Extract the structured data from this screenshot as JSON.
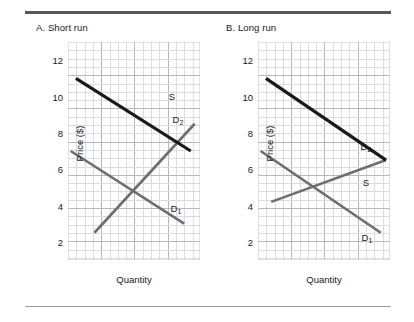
{
  "figure": {
    "panels": [
      {
        "id": "panel-a",
        "title": "A. Short run",
        "xlabel": "Quantity",
        "ylabel": "Price ($)",
        "yticks": [
          "12",
          "10",
          "8",
          "6",
          "4",
          "2"
        ],
        "labels": {
          "supply": "S",
          "demand1": "D",
          "demand1_sub": "1",
          "demand2": "D",
          "demand2_sub": "2"
        }
      },
      {
        "id": "panel-b",
        "title": "B. Long run",
        "xlabel": "Quantity",
        "ylabel": "Price ($)",
        "yticks": [
          "12",
          "10",
          "8",
          "6",
          "4",
          "2"
        ],
        "labels": {
          "supply": "S",
          "demand1": "D",
          "demand1_sub": "1",
          "demand2": "D",
          "demand2_sub": "2"
        }
      }
    ]
  },
  "chart_data": [
    {
      "type": "line",
      "title": "A. Short run",
      "xlabel": "Quantity",
      "ylabel": "Price ($)",
      "ylim": [
        1,
        13
      ],
      "yticks": [
        2,
        4,
        6,
        8,
        10,
        12
      ],
      "grid": true,
      "legend": "inline-curve-labels",
      "series": [
        {
          "name": "S",
          "role": "supply",
          "color": "#6e6e70",
          "width": 2.6,
          "note": "Steep short-run supply: inelastic",
          "points": [
            {
              "x": 0.2,
              "y": 2.5
            },
            {
              "x": 0.96,
              "y": 8.5
            }
          ]
        },
        {
          "name": "D1",
          "role": "demand-initial",
          "color": "#6e6e70",
          "width": 2.6,
          "points": [
            {
              "x": 0.02,
              "y": 7.0
            },
            {
              "x": 0.88,
              "y": 3.0
            }
          ]
        },
        {
          "name": "D2",
          "role": "demand-shifted",
          "color": "#1a1a1a",
          "width": 3.2,
          "note": "Demand shifts right/up",
          "points": [
            {
              "x": 0.06,
              "y": 11.0
            },
            {
              "x": 0.93,
              "y": 7.0
            }
          ]
        }
      ],
      "equilibria": [
        {
          "label": "initial",
          "x": 0.5,
          "y": 5.0
        },
        {
          "label": "after shift",
          "x": 0.82,
          "y": 7.5
        }
      ]
    },
    {
      "type": "line",
      "title": "B. Long run",
      "xlabel": "Quantity",
      "ylabel": "Price ($)",
      "ylim": [
        1,
        13
      ],
      "yticks": [
        2,
        4,
        6,
        8,
        10,
        12
      ],
      "grid": true,
      "legend": "inline-curve-labels",
      "series": [
        {
          "name": "S",
          "role": "supply",
          "color": "#6e6e70",
          "width": 2.6,
          "note": "Flat long-run supply: elastic",
          "points": [
            {
              "x": 0.1,
              "y": 4.2
            },
            {
              "x": 0.97,
              "y": 6.5
            }
          ]
        },
        {
          "name": "D1",
          "role": "demand-initial",
          "color": "#6e6e70",
          "width": 2.6,
          "points": [
            {
              "x": 0.02,
              "y": 7.0
            },
            {
              "x": 0.93,
              "y": 2.5
            }
          ]
        },
        {
          "name": "D2",
          "role": "demand-shifted",
          "color": "#1a1a1a",
          "width": 3.2,
          "note": "Demand shifts right/up",
          "points": [
            {
              "x": 0.06,
              "y": 11.0
            },
            {
              "x": 0.97,
              "y": 6.5
            }
          ]
        }
      ],
      "equilibria": [
        {
          "label": "initial",
          "x": 0.42,
          "y": 5.0
        },
        {
          "label": "after shift",
          "x": 0.97,
          "y": 6.5
        }
      ]
    }
  ]
}
